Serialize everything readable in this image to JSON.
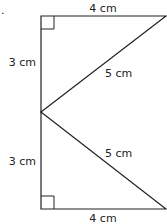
{
  "diagram": {
    "bullet": ".",
    "colors": {
      "stroke": "#222222",
      "background": "#ffffff"
    },
    "top_triangle": {
      "type": "right-triangle",
      "right_angle_at": "top-left",
      "sides": {
        "top": "4 cm",
        "left": "3 cm",
        "hypotenuse": "5 cm"
      }
    },
    "bottom_triangle": {
      "type": "right-triangle",
      "right_angle_at": "bottom-left",
      "sides": {
        "bottom": "4 cm",
        "left": "3 cm",
        "hypotenuse": "5 cm"
      }
    }
  }
}
